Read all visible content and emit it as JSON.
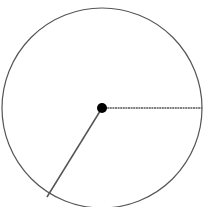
{
  "diagram": {
    "type": "circle-with-radii",
    "circle": {
      "cx": 102,
      "cy": 108,
      "r": 100,
      "stroke": "#555555",
      "stroke_width": 1.2,
      "fill": "#ffffff"
    },
    "center_point": {
      "cx": 102,
      "cy": 108,
      "r": 5,
      "fill": "#000000"
    },
    "radii": [
      {
        "name": "horizontal-radius",
        "x1": 102,
        "y1": 108,
        "x2": 202,
        "y2": 108,
        "stroke": "#555555",
        "dashed": true
      },
      {
        "name": "slanted-radius",
        "x1": 102,
        "y1": 108,
        "x2": 47,
        "y2": 197,
        "stroke": "#555555",
        "dashed": false
      }
    ]
  }
}
